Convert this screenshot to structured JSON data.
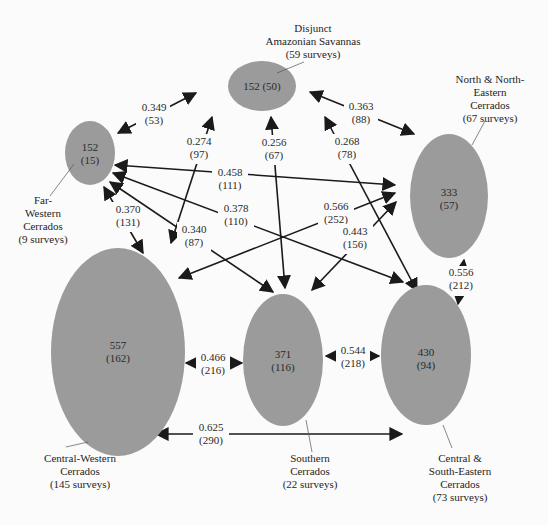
{
  "diagram": {
    "nodes": [
      {
        "id": "disjunct",
        "value": "152 (50)",
        "line1": "152 (50)",
        "line2": "",
        "name_lines": [
          "Disjunct",
          "Amazonian Savannas",
          "(59 surveys)"
        ]
      },
      {
        "id": "far_western",
        "line1": "152",
        "line2": "(15)",
        "name_lines": [
          "Far-",
          "Western",
          "Cerrados",
          "(9 surveys)"
        ]
      },
      {
        "id": "north_ne",
        "line1": "333",
        "line2": "(57)",
        "name_lines": [
          "North & North-",
          "Eastern",
          "Cerrados",
          "(67 surveys)"
        ]
      },
      {
        "id": "central_western",
        "line1": "557",
        "line2": "(162)",
        "name_lines": [
          "Central-Western",
          "Cerrados",
          "(145 surveys)"
        ]
      },
      {
        "id": "southern",
        "line1": "371",
        "line2": "(116)",
        "name_lines": [
          "Southern",
          "Cerrados",
          "(22 surveys)"
        ]
      },
      {
        "id": "central_se",
        "line1": "430",
        "line2": "(94)",
        "name_lines": [
          "Central &",
          "South-Eastern",
          "Cerrados",
          "(73 surveys)"
        ]
      }
    ],
    "edges": [
      {
        "from": "far_western",
        "to": "disjunct",
        "value": "0.349",
        "count": "(53)"
      },
      {
        "from": "disjunct",
        "to": "north_ne",
        "value": "0.363",
        "count": "(88)"
      },
      {
        "from": "central_western",
        "to": "disjunct",
        "value": "0.274",
        "count": "(97)"
      },
      {
        "from": "southern",
        "to": "disjunct",
        "value": "0.256",
        "count": "(67)"
      },
      {
        "from": "central_se",
        "to": "disjunct",
        "value": "0.268",
        "count": "(78)"
      },
      {
        "from": "far_western",
        "to": "north_ne",
        "value": "0.458",
        "count": "(111)"
      },
      {
        "from": "far_western",
        "to": "central_western",
        "value": "0.370",
        "count": "(131)"
      },
      {
        "from": "far_western",
        "to": "southern",
        "value": "0.340",
        "count": "(87)"
      },
      {
        "from": "far_western",
        "to": "central_se",
        "value": "0.378",
        "count": "(110)"
      },
      {
        "from": "central_western",
        "to": "north_ne",
        "value": "0.566",
        "count": "(252)"
      },
      {
        "from": "southern",
        "to": "north_ne",
        "value": "0.443",
        "count": "(156)"
      },
      {
        "from": "north_ne",
        "to": "central_se",
        "value": "0.556",
        "count": "(212)"
      },
      {
        "from": "central_western",
        "to": "southern",
        "value": "0.466",
        "count": "(216)"
      },
      {
        "from": "southern",
        "to": "central_se",
        "value": "0.544",
        "count": "(218)"
      },
      {
        "from": "central_western",
        "to": "central_se",
        "value": "0.625",
        "count": "(290)"
      }
    ],
    "colors": {
      "node_fill": "#9b9b9b",
      "edge": "#1a1a1a",
      "background": "#fbfbfb"
    }
  }
}
